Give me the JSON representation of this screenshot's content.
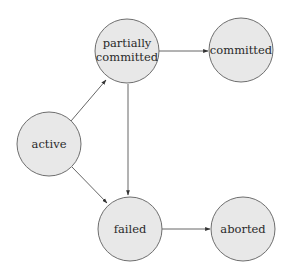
{
  "diagram": {
    "type": "state-transition",
    "colors": {
      "node_fill": "#e8e8e8",
      "node_stroke": "#6e6e6e",
      "edge": "#555555",
      "text": "#2a2a2a"
    },
    "nodes": [
      {
        "id": "active",
        "label_lines": [
          "active"
        ],
        "cx": 49,
        "cy": 144,
        "r": 32
      },
      {
        "id": "partially_committed",
        "label_lines": [
          "partially",
          "committed"
        ],
        "cx": 127,
        "cy": 51,
        "r": 32
      },
      {
        "id": "committed",
        "label_lines": [
          "committed"
        ],
        "cx": 241,
        "cy": 50,
        "r": 32
      },
      {
        "id": "failed",
        "label_lines": [
          "failed"
        ],
        "cx": 130,
        "cy": 229,
        "r": 32
      },
      {
        "id": "aborted",
        "label_lines": [
          "aborted"
        ],
        "cx": 243,
        "cy": 229,
        "r": 32
      }
    ],
    "edges": [
      {
        "from": "active",
        "to": "partially_committed"
      },
      {
        "from": "active",
        "to": "failed"
      },
      {
        "from": "partially_committed",
        "to": "committed"
      },
      {
        "from": "partially_committed",
        "to": "failed"
      },
      {
        "from": "failed",
        "to": "aborted"
      }
    ]
  }
}
